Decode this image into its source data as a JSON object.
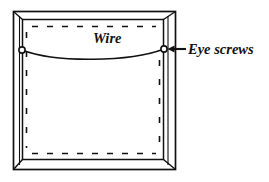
{
  "figure": {
    "type": "line-art-diagram",
    "background_color": "#ffffff",
    "ink_color": "#111111",
    "labels": {
      "wire": "Wire",
      "eye_screws": "Eye screws"
    },
    "parts": [
      {
        "name": "frame",
        "description": "rectangular picture frame, mitered corners, drawn as double outline"
      },
      {
        "name": "hidden-edges",
        "description": "dashed lines indicating concealed inner rabbet edges"
      },
      {
        "name": "eye-screw-left",
        "description": "small open circle on left rail"
      },
      {
        "name": "eye-screw-right",
        "description": "small open circle on right rail"
      },
      {
        "name": "wire",
        "description": "wire sagging between the two eye screws"
      },
      {
        "name": "leader-arrow",
        "description": "arrow from the Eye screws label to the right eye screw"
      }
    ],
    "geometry": {
      "frame_outer": {
        "x": 13,
        "y": 11,
        "width": 163,
        "height": 159
      },
      "frame_inner": {
        "x": 23,
        "y": 20,
        "width": 141,
        "height": 140
      },
      "eye_screw_left": {
        "cx": 22,
        "cy": 50,
        "r": 3.1
      },
      "eye_screw_right": {
        "cx": 164,
        "cy": 49,
        "r": 3.1
      },
      "wire_sag_y": 60,
      "wire_label_position": {
        "x": 93,
        "y": 43
      },
      "eye_screws_label_position": {
        "x": 188,
        "y": 53
      },
      "arrow_from": {
        "x": 186,
        "y": 49
      },
      "arrow_to": {
        "x": 168,
        "y": 49
      }
    }
  }
}
